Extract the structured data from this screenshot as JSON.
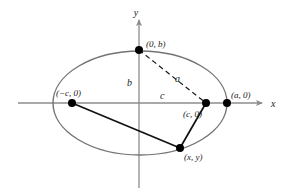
{
  "figure": {
    "background_color": "#ffffff",
    "axis_color": "#8c8c8c",
    "curve_color": "#737373",
    "line_color": "#111111",
    "dash_color": "#1a1a1a",
    "point_color": "#000000"
  },
  "axes": {
    "x_label": "x",
    "y_label": "y",
    "origin": {
      "x": 139,
      "y": 103
    },
    "x_start": 18,
    "x_end": 266,
    "y_start": 16,
    "y_end": 188
  },
  "ellipse": {
    "center_x": 140,
    "center_y": 103,
    "semi_major": 87,
    "semi_minor": 52
  },
  "points": [
    {
      "name": "co-vertex-top",
      "label": "(0, b)",
      "x": 139,
      "y": 50,
      "label_x": 146,
      "label_y": 47
    },
    {
      "name": "focus-left",
      "label": "(−c, 0)",
      "x": 72,
      "y": 103,
      "label_x": 56,
      "label_y": 96
    },
    {
      "name": "focus-right",
      "label": "(c, 0)",
      "x": 206,
      "y": 103,
      "label_x": 183,
      "label_y": 117
    },
    {
      "name": "vertex-right",
      "label": "(a, 0)",
      "x": 227,
      "y": 103,
      "label_x": 231,
      "label_y": 98
    },
    {
      "name": "point-on-ellipse",
      "label": "(x, y)",
      "x": 180,
      "y": 148,
      "label_x": 184,
      "label_y": 160
    }
  ],
  "segment_labels": [
    {
      "name": "semi-minor-axis-label",
      "text": "b",
      "x": 127,
      "y": 86
    },
    {
      "name": "focal-distance-label",
      "text": "c",
      "x": 160,
      "y": 99
    },
    {
      "name": "semi-major-distance-label",
      "text": "a",
      "x": 177,
      "y": 82
    }
  ],
  "segments": {
    "dashed": {
      "name": "covertex-to-focus-dashed",
      "x1": 139,
      "y1": 50,
      "x2": 206,
      "y2": 103
    },
    "solid": [
      {
        "name": "left-focus-to-point",
        "x1": 72,
        "y1": 103,
        "x2": 180,
        "y2": 148
      },
      {
        "name": "right-focus-to-point",
        "x1": 206,
        "y1": 103,
        "x2": 180,
        "y2": 148
      }
    ]
  }
}
